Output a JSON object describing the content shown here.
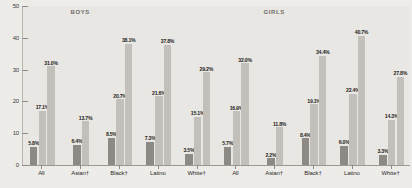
{
  "chart_data": {
    "type": "bar",
    "title": "",
    "xlabel": "",
    "ylabel": "",
    "ylim": [
      0,
      50
    ],
    "yticks": [
      0,
      10,
      20,
      30,
      40,
      50
    ],
    "ytick_labels": [
      "0",
      "10",
      "20",
      "30",
      "40",
      "50"
    ],
    "grid": false,
    "legend_position": "none",
    "panels": [
      {
        "header": "BOYS",
        "categories": [
          "All",
          "Asian†",
          "Black†",
          "Latino",
          "White†"
        ],
        "series": [
          {
            "name": "series-dark",
            "values": [
              5.8,
              6.4,
              8.5,
              7.3,
              3.5
            ],
            "labels": [
              "5.8%",
              "6.4%",
              "8.5%",
              "7.3%",
              "3.5%"
            ]
          },
          {
            "name": "series-light",
            "values": [
              17.1,
              13.7,
              20.7,
              21.6,
              15.1
            ],
            "labels": [
              "17.1%",
              "13.7%",
              "20.7%",
              "21.6%",
              "15.1%"
            ]
          }
        ]
      },
      {
        "header": "GIRLS",
        "categories": [
          "All",
          "Asian†",
          "Black†",
          "Latino",
          "White†"
        ],
        "series": [
          {
            "name": "series-dark",
            "values": [
              5.7,
              2.2,
              8.4,
              6.0,
              3.3
            ],
            "labels": [
              "5.7%",
              "2.2%",
              "8.4%",
              "6.0%",
              "3.3%"
            ]
          },
          {
            "name": "series-light",
            "values": [
              16.9,
              11.8,
              19.1,
              22.4,
              14.3
            ],
            "labels": [
              "16.9%",
              "11.8%",
              "19.1%",
              "22.4%",
              "14.3%"
            ]
          }
        ]
      }
    ],
    "extra_bars": [
      {
        "panel": 0,
        "after_category": "White†",
        "value": 29.2,
        "label": "29.2%",
        "series": "series-light"
      },
      {
        "panel": 0,
        "after_category": "All",
        "value": 31.0,
        "label": "31.0%",
        "series": "series-light"
      },
      {
        "panel": 0,
        "after_category": "Black†",
        "value": 38.1,
        "label": "38.1%",
        "series": "series-light"
      },
      {
        "panel": 0,
        "after_category": "Latino",
        "value": 37.8,
        "label": "37.8%",
        "series": "series-light"
      },
      {
        "panel": 1,
        "after_category": "All",
        "value": 32.0,
        "label": "32.0%",
        "series": "series-light"
      },
      {
        "panel": 1,
        "after_category": "Black†",
        "value": 34.4,
        "label": "34.4%",
        "series": "series-light"
      },
      {
        "panel": 1,
        "after_category": "Latino",
        "value": 40.7,
        "label": "40.7%",
        "series": "series-light"
      },
      {
        "panel": 1,
        "after_category": "White†",
        "value": 27.8,
        "label": "27.8%",
        "series": "series-light"
      }
    ],
    "bars_flat": [
      {
        "panel": "BOYS",
        "category": "All",
        "group": "dark",
        "value": 5.8,
        "label": "5.8%"
      },
      {
        "panel": "BOYS",
        "category": "All",
        "group": "mid",
        "value": 17.1,
        "label": "17.1%"
      },
      {
        "panel": "BOYS",
        "category": "All",
        "group": "light",
        "value": 31.0,
        "label": "31.0%"
      },
      {
        "panel": "BOYS",
        "category": "Asian†",
        "group": "dark",
        "value": 6.4,
        "label": "6.4%"
      },
      {
        "panel": "BOYS",
        "category": "Asian†",
        "group": "mid",
        "value": 13.7,
        "label": "13.7%"
      },
      {
        "panel": "BOYS",
        "category": "Black†",
        "group": "dark",
        "value": 8.5,
        "label": "8.5%"
      },
      {
        "panel": "BOYS",
        "category": "Black†",
        "group": "mid",
        "value": 20.7,
        "label": "20.7%"
      },
      {
        "panel": "BOYS",
        "category": "Black†",
        "group": "light",
        "value": 38.1,
        "label": "38.1%"
      },
      {
        "panel": "BOYS",
        "category": "Latino",
        "group": "dark",
        "value": 7.3,
        "label": "7.3%"
      },
      {
        "panel": "BOYS",
        "category": "Latino",
        "group": "mid",
        "value": 21.6,
        "label": "21.6%"
      },
      {
        "panel": "BOYS",
        "category": "Latino",
        "group": "light",
        "value": 37.8,
        "label": "37.8%"
      },
      {
        "panel": "BOYS",
        "category": "White†",
        "group": "dark",
        "value": 3.5,
        "label": "3.5%"
      },
      {
        "panel": "BOYS",
        "category": "White†",
        "group": "mid",
        "value": 15.1,
        "label": "15.1%"
      },
      {
        "panel": "BOYS",
        "category": "White†",
        "group": "light",
        "value": 29.2,
        "label": "29.2%"
      },
      {
        "panel": "GIRLS",
        "category": "All",
        "group": "dark",
        "value": 5.7,
        "label": "5.7%"
      },
      {
        "panel": "GIRLS",
        "category": "All",
        "group": "mid",
        "value": 16.9,
        "label": "16.9%"
      },
      {
        "panel": "GIRLS",
        "category": "All",
        "group": "light",
        "value": 32.0,
        "label": "32.0%"
      },
      {
        "panel": "GIRLS",
        "category": "Asian†",
        "group": "dark",
        "value": 2.2,
        "label": "2.2%"
      },
      {
        "panel": "GIRLS",
        "category": "Asian†",
        "group": "mid",
        "value": 11.8,
        "label": "11.8%"
      },
      {
        "panel": "GIRLS",
        "category": "Black†",
        "group": "dark",
        "value": 8.4,
        "label": "8.4%"
      },
      {
        "panel": "GIRLS",
        "category": "Black†",
        "group": "mid",
        "value": 19.1,
        "label": "19.1%"
      },
      {
        "panel": "GIRLS",
        "category": "Black†",
        "group": "light",
        "value": 34.4,
        "label": "34.4%"
      },
      {
        "panel": "GIRLS",
        "category": "Latino",
        "group": "dark",
        "value": 6.0,
        "label": "6.0%"
      },
      {
        "panel": "GIRLS",
        "category": "Latino",
        "group": "mid",
        "value": 22.4,
        "label": "22.4%"
      },
      {
        "panel": "GIRLS",
        "category": "Latino",
        "group": "light",
        "value": 40.7,
        "label": "40.7%"
      },
      {
        "panel": "GIRLS",
        "category": "White†",
        "group": "dark",
        "value": 3.3,
        "label": "3.3%"
      },
      {
        "panel": "GIRLS",
        "category": "White†",
        "group": "mid",
        "value": 14.3,
        "label": "14.3%"
      },
      {
        "panel": "GIRLS",
        "category": "White†",
        "group": "light",
        "value": 27.8,
        "label": "27.8%"
      }
    ],
    "colors": {
      "bar_dark": "#8d8a85",
      "bar_light": "#c3c0bb",
      "background": "#e9e7e3",
      "axis": "#9c9994",
      "text": "#1e1e1c"
    }
  }
}
